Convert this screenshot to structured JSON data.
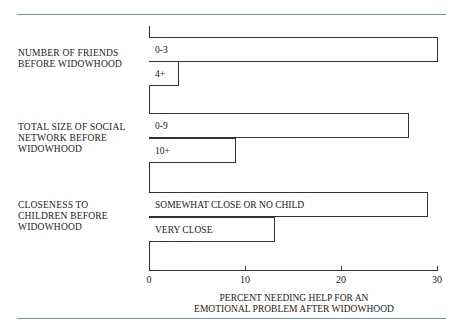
{
  "chart_data": {
    "type": "bar",
    "orientation": "horizontal",
    "title": "",
    "xlabel": "PERCENT NEEDING HELP FOR AN\nEMOTIONAL PROBLEM AFTER WIDOWHOOD",
    "ylabel": "",
    "xlim": [
      0,
      30
    ],
    "xticks": [
      0,
      10,
      20,
      30
    ],
    "grid": false,
    "groups": [
      {
        "label": "NUMBER OF FRIENDS\nBEFORE WIDOWHOOD",
        "bars": [
          {
            "label": "0-3",
            "value": 30
          },
          {
            "label": "4+",
            "value": 3
          }
        ]
      },
      {
        "label": "TOTAL SIZE OF SOCIAL\nNETWORK BEFORE\nWIDOWHOOD",
        "bars": [
          {
            "label": "0-9",
            "value": 27
          },
          {
            "label": "10+",
            "value": 9
          }
        ]
      },
      {
        "label": "CLOSENESS TO\nCHILDREN BEFORE\nWIDOWHOOD",
        "bars": [
          {
            "label": "SOMEWHAT CLOSE OR NO CHILD",
            "value": 29
          },
          {
            "label": "VERY CLOSE",
            "value": 13
          }
        ]
      }
    ]
  },
  "colors": {
    "rule": "#6f93b5",
    "bar_fill": "#ffffff",
    "bar_stroke": "#333333"
  }
}
